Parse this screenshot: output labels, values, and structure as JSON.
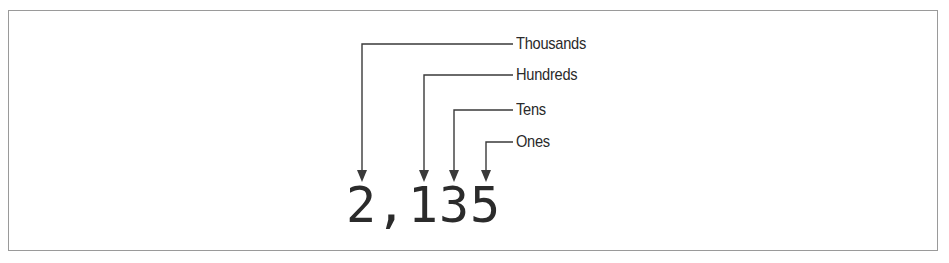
{
  "diagram": {
    "number": "2,135",
    "characters": [
      {
        "char": "2",
        "x": 349
      },
      {
        "char": ",",
        "x": 378
      },
      {
        "char": "1",
        "x": 409
      },
      {
        "char": "3",
        "x": 440
      },
      {
        "char": "5",
        "x": 471
      }
    ],
    "labels": [
      {
        "text": "Thousands",
        "y": 44,
        "target_x": 362
      },
      {
        "text": "Hundreds",
        "y": 75,
        "target_x": 424
      },
      {
        "text": "Tens",
        "y": 110,
        "target_x": 454
      },
      {
        "text": "Ones",
        "y": 142,
        "target_x": 486
      }
    ],
    "colors": {
      "line": "#3a3a3a",
      "text": "#2a2a2a",
      "border": "#9a9a9a"
    }
  }
}
